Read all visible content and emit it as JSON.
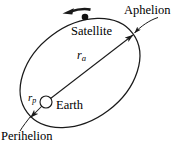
{
  "figure": {
    "background_color": "#ffffff",
    "stroke_color": "#1a1a1a",
    "width": 174,
    "height": 145
  },
  "labels": {
    "aphelion": "Aphelion",
    "satellite": "Satellite",
    "earth": "Earth",
    "perihelion": "Perihelion",
    "r_apoapsis_symbol": "r",
    "r_apoapsis_subscript": "a",
    "r_periapsis_symbol": "r",
    "r_periapsis_subscript": "p"
  },
  "diagram_data": {
    "type": "orbital-diagram",
    "orbit": {
      "shape": "ellipse",
      "center_px": [
        80,
        73
      ],
      "semi_major_px": 66,
      "semi_minor_px": 47,
      "rotation_deg": -37
    },
    "earth": {
      "shape": "circle",
      "center_px": [
        46,
        102
      ],
      "radius_px": 6,
      "fill": "#ffffff",
      "role": "focus"
    },
    "satellite": {
      "shape": "filled-dot",
      "center_px": [
        85,
        17
      ],
      "radius_px": 3.2,
      "fill": "#000000"
    },
    "direction_arrow": {
      "label": "orbital direction",
      "from_px": [
        91,
        9
      ],
      "to_px": [
        63,
        13
      ],
      "sense": "counterclockwise"
    },
    "radius_vectors": [
      {
        "name": "r_a",
        "meaning": "apoapsis radius",
        "from_px": [
          46,
          102
        ],
        "to_px": [
          134,
          34
        ]
      },
      {
        "name": "r_p",
        "meaning": "periapsis radius",
        "from_px": [
          44,
          104
        ],
        "to_px": [
          29,
          119
        ]
      }
    ],
    "leader_lines": [
      {
        "name": "aphelion-leader",
        "from_px": [
          156,
          18
        ],
        "to_px": [
          133,
          35
        ]
      },
      {
        "name": "perihelion-leader",
        "from_px": [
          22,
          131
        ],
        "to_px": [
          31,
          116
        ]
      }
    ]
  }
}
